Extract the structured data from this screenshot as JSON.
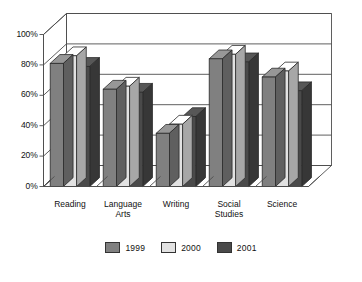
{
  "chart_data": {
    "type": "bar",
    "title": "",
    "subtitle": "",
    "xlabel": "",
    "ylabel": "",
    "ylim": [
      0,
      100
    ],
    "y_tick_labels": [
      "0%",
      "20%",
      "40%",
      "60%",
      "80%",
      "100%"
    ],
    "y_ticks": [
      0,
      20,
      40,
      60,
      80,
      100
    ],
    "grid": true,
    "legend_position": "bottom",
    "three_d": true,
    "categories": [
      "Reading",
      "Language Arts",
      "Writing",
      "Social Studies",
      "Science"
    ],
    "series": [
      {
        "name": "1999",
        "color": "#808080",
        "values": [
          81,
          64,
          35,
          84,
          72
        ]
      },
      {
        "name": "2000",
        "color": "#e2e2e2",
        "values": [
          86,
          66,
          41,
          87,
          76
        ]
      },
      {
        "name": "2001",
        "color": "#4a4a4a",
        "values": [
          79,
          62,
          46,
          82,
          63
        ]
      }
    ]
  },
  "axis": {
    "tick_labels": [
      "100%",
      "80%",
      "60%",
      "40%",
      "20%",
      "0%"
    ]
  },
  "categories": [
    {
      "line1": "Reading",
      "line2": ""
    },
    {
      "line1": "Language",
      "line2": "Arts"
    },
    {
      "line1": "Writing",
      "line2": ""
    },
    {
      "line1": "Social",
      "line2": "Studies"
    },
    {
      "line1": "Science",
      "line2": ""
    }
  ],
  "legend": {
    "items": [
      {
        "label": "1999",
        "color": "#808080"
      },
      {
        "label": "2000",
        "color": "#e2e2e2"
      },
      {
        "label": "2001",
        "color": "#4a4a4a"
      }
    ]
  }
}
